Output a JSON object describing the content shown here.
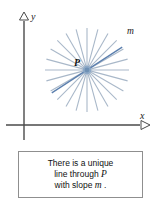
{
  "figure": {
    "type": "geometry-diagram",
    "axes": {
      "x_label": "x",
      "y_label": "y",
      "origin_px": [
        24,
        125
      ],
      "arrowhead_style": "hollow-triangle",
      "axis_color": "#4a4a4a"
    },
    "point": {
      "label": "P",
      "center_px": [
        87,
        70
      ],
      "dot_color": "#7d9ec4"
    },
    "pencil_of_lines": {
      "count": 12,
      "angle_step_degrees": 15,
      "radius_px": 42,
      "line_color": "#a9b8c9",
      "highlighted": {
        "label": "m",
        "angle_degrees": 33,
        "color": "#5b7fae"
      }
    }
  },
  "caption": {
    "line1": "There is a unique",
    "line2_pre": "line through ",
    "line2_math": "P",
    "line3_pre": "with slope ",
    "line3_math": "m",
    "line3_post": " ."
  },
  "colors": {
    "background": "#ffffff",
    "axis": "#4a4a4a",
    "ray": "#a9b8c9",
    "highlight": "#5b7fae",
    "box_border": "#8f8f8f",
    "text": "#111111"
  }
}
